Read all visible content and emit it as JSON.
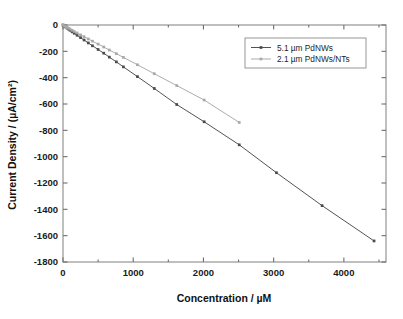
{
  "chart_data": {
    "type": "scatter",
    "title": "",
    "xlabel": "Concentration  /  µM",
    "ylabel": "Current Density  /  (µA/cm²)",
    "xlim": [
      0,
      4600
    ],
    "ylim": [
      -1800,
      0
    ],
    "xticks": [
      0,
      1000,
      2000,
      3000,
      4000
    ],
    "xtick_labels": [
      "0",
      "1000",
      "2000",
      "3000",
      "4000"
    ],
    "yticks": [
      0,
      -200,
      -400,
      -600,
      -800,
      -1000,
      -1200,
      -1400,
      -1600,
      -1800
    ],
    "ytick_labels": [
      "0",
      "-200",
      "-400",
      "-600",
      "-800",
      "-1000",
      "-1200",
      "-1400",
      "-1600",
      "-1800"
    ],
    "grid": false,
    "legend_position": "upper right",
    "minor_ticks_top_and_right": true,
    "series": [
      {
        "name": "5.1 µm PdNWs",
        "color": "#4a4a4a",
        "marker": "square",
        "x": [
          0,
          20,
          40,
          60,
          80,
          100,
          130,
          160,
          200,
          250,
          300,
          360,
          420,
          500,
          580,
          660,
          760,
          860,
          1060,
          1300,
          1620,
          2010,
          2510,
          3040,
          3690,
          4430
        ],
        "y": [
          0,
          -8,
          -16,
          -24,
          -32,
          -40,
          -52,
          -63,
          -78,
          -96,
          -114,
          -136,
          -158,
          -186,
          -214,
          -244,
          -280,
          -318,
          -392,
          -482,
          -604,
          -735,
          -910,
          -1122,
          -1372,
          -1640
        ]
      },
      {
        "name": "2.1 µm PdNWs/NTs",
        "color": "#a8a8a8",
        "marker": "square",
        "x": [
          0,
          20,
          40,
          60,
          80,
          100,
          130,
          160,
          200,
          250,
          300,
          360,
          420,
          500,
          580,
          660,
          760,
          860,
          1060,
          1300,
          1620,
          2010,
          2510
        ],
        "y": [
          0,
          -6,
          -13,
          -19,
          -25,
          -31,
          -40,
          -49,
          -60,
          -75,
          -89,
          -106,
          -123,
          -145,
          -167,
          -190,
          -218,
          -246,
          -302,
          -370,
          -460,
          -570,
          -740
        ]
      }
    ]
  },
  "legend": {
    "entries": [
      {
        "label": "5.1 µm PdNWs"
      },
      {
        "label": "2.1 µm PdNWs/NTs"
      }
    ]
  },
  "colors": {
    "series_1": "#4a4a4a",
    "series_2": "#a8a8a8",
    "axis": "#8a8a8a",
    "text": "#1a1a1a",
    "background": "#ffffff"
  }
}
